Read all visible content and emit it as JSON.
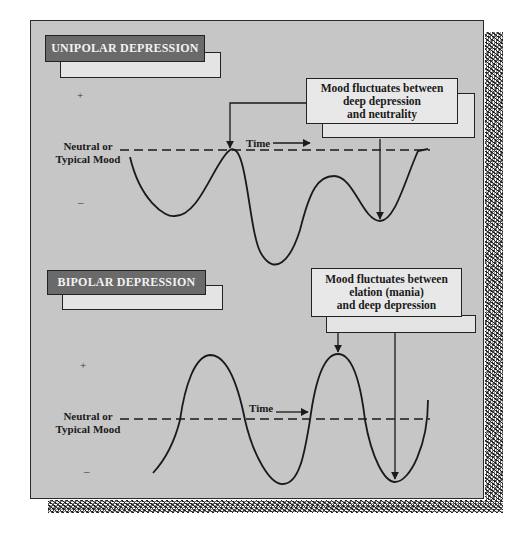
{
  "figure": {
    "panels": [
      {
        "id": "unipolar",
        "title": "UNIPOLAR DEPRESSION",
        "annotation_lines": [
          "Mood fluctuates between",
          "deep depression",
          "and neutrality"
        ],
        "baseline_label_lines": [
          "Neutral or",
          "Typical Mood"
        ],
        "time_label": "Time",
        "plus_symbol": "+",
        "minus_symbol": "–"
      },
      {
        "id": "bipolar",
        "title": "BIPOLAR DEPRESSION",
        "annotation_lines": [
          "Mood fluctuates between",
          "elation (mania)",
          "and deep depression"
        ],
        "baseline_label_lines": [
          "Neutral or",
          "Typical Mood"
        ],
        "time_label": "Time",
        "plus_symbol": "+",
        "minus_symbol": "–"
      }
    ],
    "colors": {
      "panel_bg": "#c6c6c6",
      "title_box": "#6a6a6a",
      "title_text": "#f2f2f2",
      "note_box": "#e8e8e8",
      "line": "#1a1a1a"
    }
  }
}
